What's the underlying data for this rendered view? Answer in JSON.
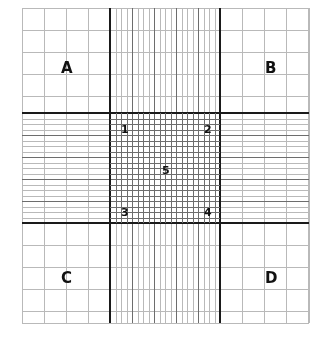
{
  "figure": {
    "kind": "neubauer-improved-ruling",
    "background_color": "#ffffff",
    "line_color_thin": "#b9b9b9",
    "line_color_medium": "#6d6d6d",
    "line_color_thick": "#1a1a1a",
    "label_color": "#111111"
  },
  "grid": {
    "outer_left": 22,
    "outer_top": 8,
    "outer_right": 309,
    "outer_bottom": 323,
    "band_left": 110,
    "band_right": 220,
    "band_top": 113,
    "band_bottom": 223,
    "corner_cells_per_side": 4,
    "central_squares_per_side": 5,
    "subsquares_per_central_square": 4,
    "corner_line_spacing": 22,
    "central_square_spacing": 22,
    "sub_line_spacing": 5.5
  },
  "labels": {
    "quadrants": [
      {
        "text": "A",
        "x": 61,
        "y": 61,
        "name": "quadrant-label-a"
      },
      {
        "text": "B",
        "x": 265,
        "y": 61,
        "name": "quadrant-label-b"
      },
      {
        "text": "C",
        "x": 61,
        "y": 271,
        "name": "quadrant-label-c"
      },
      {
        "text": "D",
        "x": 265,
        "y": 271,
        "name": "quadrant-label-d"
      }
    ],
    "central_squares": [
      {
        "text": "1",
        "x": 121,
        "y": 124,
        "name": "central-square-label-1"
      },
      {
        "text": "2",
        "x": 204,
        "y": 124,
        "name": "central-square-label-2"
      },
      {
        "text": "5",
        "x": 162,
        "y": 165,
        "name": "central-square-label-5"
      },
      {
        "text": "3",
        "x": 121,
        "y": 207,
        "name": "central-square-label-3"
      },
      {
        "text": "4",
        "x": 204,
        "y": 207,
        "name": "central-square-label-4"
      }
    ]
  }
}
